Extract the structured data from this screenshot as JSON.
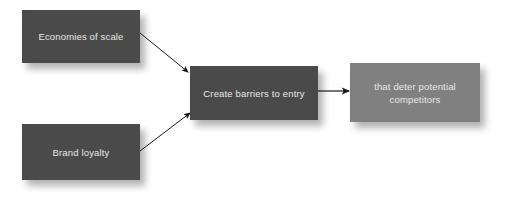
{
  "diagram": {
    "background_color": "#ffffff",
    "nodes": [
      {
        "id": "economies",
        "label": "Economies of scale",
        "fill": "#4a4a4a",
        "text_color": "#e8e8e8"
      },
      {
        "id": "brand",
        "label": "Brand loyalty",
        "fill": "#4a4a4a",
        "text_color": "#e8e8e8"
      },
      {
        "id": "barriers",
        "label": "Create barriers to entry",
        "fill": "#4a4a4a",
        "text_color": "#e8e8e8"
      },
      {
        "id": "deter",
        "label": "that deter potential competitors",
        "line1": "that deter potential",
        "line2": "competitors",
        "fill": "#808080",
        "text_color": "#e8e8e8"
      }
    ],
    "connectors": [
      {
        "id": "economies-to-barriers",
        "from": "economies",
        "to": "barriers",
        "color": "#1a1a1a",
        "style": "arrow"
      },
      {
        "id": "brand-to-barriers",
        "from": "brand",
        "to": "barriers",
        "color": "#1a1a1a",
        "style": "arrow"
      },
      {
        "id": "barriers-to-deter",
        "from": "barriers",
        "to": "deter",
        "color": "#1a1a1a",
        "style": "arrow"
      }
    ]
  }
}
